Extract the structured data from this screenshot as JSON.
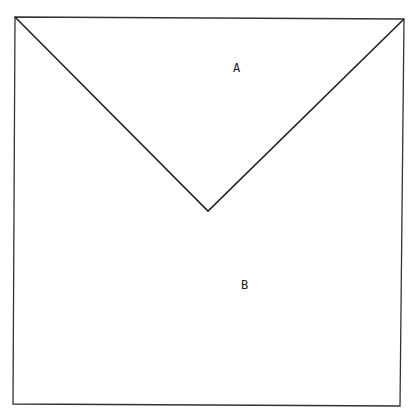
{
  "diagram": {
    "type": "square divided by V shape",
    "regions": [
      {
        "id": "A",
        "label": "A"
      },
      {
        "id": "B",
        "label": "B"
      }
    ],
    "line_color": "#222222",
    "background": "#ffffff"
  }
}
